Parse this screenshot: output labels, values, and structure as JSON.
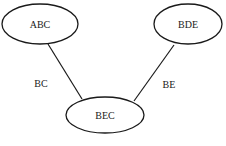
{
  "diagram": {
    "type": "graph",
    "nodes": [
      {
        "id": "ABC",
        "label": "ABC",
        "cx": 40,
        "cy": 24,
        "rx": 38,
        "ry": 20
      },
      {
        "id": "BDE",
        "label": "BDE",
        "cx": 188,
        "cy": 24,
        "rx": 34,
        "ry": 20
      },
      {
        "id": "BEC",
        "label": "BEC",
        "cx": 105,
        "cy": 115,
        "rx": 39,
        "ry": 18
      }
    ],
    "edges": [
      {
        "from": "ABC",
        "to": "BEC",
        "label": "BC"
      },
      {
        "from": "BDE",
        "to": "BEC",
        "label": "BE"
      }
    ]
  },
  "colors": {
    "stroke": "#1a1a1a",
    "background": "#ffffff"
  }
}
